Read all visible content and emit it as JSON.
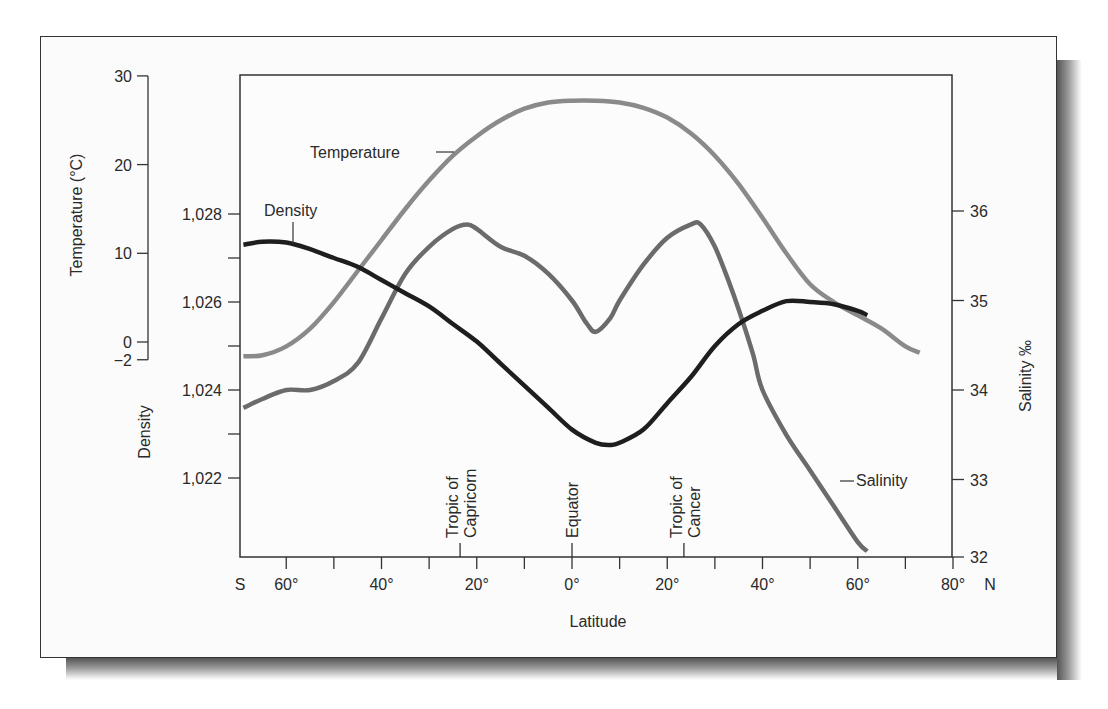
{
  "chart_data": {
    "type": "line",
    "title": "",
    "xlabel": "Latitude",
    "x_ticks": [
      {
        "value": -60,
        "label": "60°"
      },
      {
        "value": -40,
        "label": "40°"
      },
      {
        "value": -20,
        "label": "20°"
      },
      {
        "value": 0,
        "label": "0°"
      },
      {
        "value": 20,
        "label": "20°"
      },
      {
        "value": 40,
        "label": "40°"
      },
      {
        "value": 60,
        "label": "60°"
      },
      {
        "value": 80,
        "label": "80°"
      }
    ],
    "x_end_labels": {
      "south": "S",
      "north": "N"
    },
    "xlim": [
      -69,
      80
    ],
    "axes": {
      "temperature": {
        "label": "Temperature (°C)",
        "ticks": [
          "30",
          "20",
          "10",
          "0",
          "−2"
        ],
        "values": [
          30,
          20,
          10,
          0,
          -2
        ],
        "ylim": [
          -2,
          30
        ]
      },
      "density": {
        "label": "Density",
        "ticks": [
          "1,028",
          "1,026",
          "1,024",
          "1,022"
        ],
        "values": [
          1.028,
          1.026,
          1.024,
          1.022
        ],
        "ylim": [
          1.0212,
          1.0286
        ]
      },
      "salinity": {
        "label": "Salinity ‰",
        "ticks": [
          "36",
          "35",
          "34",
          "33",
          "32"
        ],
        "values": [
          36,
          35,
          34,
          33,
          32
        ],
        "ylim": [
          32,
          37.5
        ]
      }
    },
    "markers": [
      {
        "lat": -23.5,
        "label_line1": "Tropic of",
        "label_line2": "Capricorn"
      },
      {
        "lat": 0,
        "label_line1": "Equator",
        "label_line2": ""
      },
      {
        "lat": 23.5,
        "label_line1": "Tropic of",
        "label_line2": "Cancer"
      }
    ],
    "series": [
      {
        "name": "Temperature",
        "axis": "temperature",
        "color": "#8a8a8a",
        "x": [
          -69,
          -65,
          -60,
          -55,
          -50,
          -45,
          -40,
          -35,
          -30,
          -25,
          -20,
          -15,
          -10,
          -5,
          0,
          5,
          10,
          15,
          20,
          25,
          30,
          35,
          40,
          45,
          50,
          55,
          60,
          65,
          70,
          73
        ],
        "values": [
          -1.6,
          -1.5,
          -0.5,
          1.5,
          4.5,
          8.0,
          11.5,
          15.0,
          18.2,
          21.0,
          23.2,
          25.0,
          26.3,
          27.0,
          27.2,
          27.2,
          27.0,
          26.4,
          25.3,
          23.5,
          21.0,
          17.8,
          14.0,
          10.0,
          6.5,
          4.5,
          3.0,
          1.5,
          -0.5,
          -1.2
        ]
      },
      {
        "name": "Salinity",
        "axis": "salinity",
        "color": "#6b6b6b",
        "x": [
          -69,
          -65,
          -60,
          -55,
          -50,
          -45,
          -40,
          -35,
          -30,
          -25,
          -22,
          -20,
          -15,
          -10,
          -5,
          0,
          3,
          5,
          8,
          10,
          15,
          20,
          25,
          27,
          30,
          33,
          35,
          38,
          40,
          45,
          50,
          55,
          60,
          62
        ],
        "values": [
          33.8,
          33.9,
          34.0,
          34.0,
          34.1,
          34.3,
          34.8,
          35.3,
          35.6,
          35.8,
          35.85,
          35.8,
          35.6,
          35.5,
          35.3,
          35.0,
          34.75,
          34.65,
          34.8,
          35.0,
          35.4,
          35.7,
          35.85,
          35.85,
          35.6,
          35.2,
          34.9,
          34.4,
          34.0,
          33.5,
          33.1,
          32.7,
          32.3,
          32.2
        ]
      },
      {
        "name": "Density",
        "axis": "density",
        "color": "#1e1e1e",
        "x": [
          -69,
          -65,
          -60,
          -55,
          -50,
          -45,
          -40,
          -35,
          -30,
          -25,
          -20,
          -15,
          -10,
          -5,
          0,
          5,
          8,
          10,
          15,
          20,
          25,
          30,
          35,
          40,
          45,
          50,
          55,
          60,
          62
        ],
        "values": [
          1.0273,
          1.02737,
          1.02735,
          1.0272,
          1.027,
          1.0268,
          1.0265,
          1.0262,
          1.0259,
          1.0255,
          1.0251,
          1.0246,
          1.0241,
          1.0236,
          1.0231,
          1.0228,
          1.02275,
          1.0228,
          1.0231,
          1.0237,
          1.0243,
          1.025,
          1.0255,
          1.0258,
          1.02602,
          1.026,
          1.02595,
          1.0258,
          1.0257
        ]
      }
    ],
    "series_labels": {
      "temperature": "Temperature",
      "density": "Density",
      "salinity": "Salinity"
    },
    "grid": false,
    "legend": "inline labels"
  }
}
